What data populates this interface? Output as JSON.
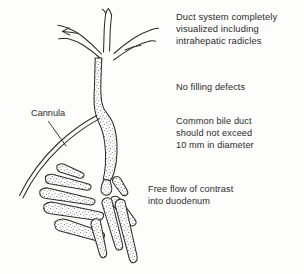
{
  "figure": {
    "title_alt": "Normal operative cholangiogram line drawing",
    "ink_color": "#2e2e2e",
    "stipple_color": "#565656",
    "background_color": "#fdfdfc",
    "parts": {
      "intrahepatic_radicles": "intrahepatic-radicles",
      "common_hepatic_duct": "common-hepatic-duct",
      "common_bile_duct": "common-bile-duct",
      "cannula": "cannula-tube",
      "duodenum": "duodenum-folds",
      "ampulla": "ampulla-of-vater"
    }
  },
  "labels": {
    "cannula": "Cannula"
  },
  "notes": {
    "duct_system": "Duct system completely\nvisualized including\nintrahepatic radicles",
    "no_filling_defects": "No filling defects",
    "common_bile_duct": "Common bile duct\nshould not exceed\n10 mm  in  diameter",
    "free_flow": "Free flow of contrast\ninto duodenum"
  }
}
